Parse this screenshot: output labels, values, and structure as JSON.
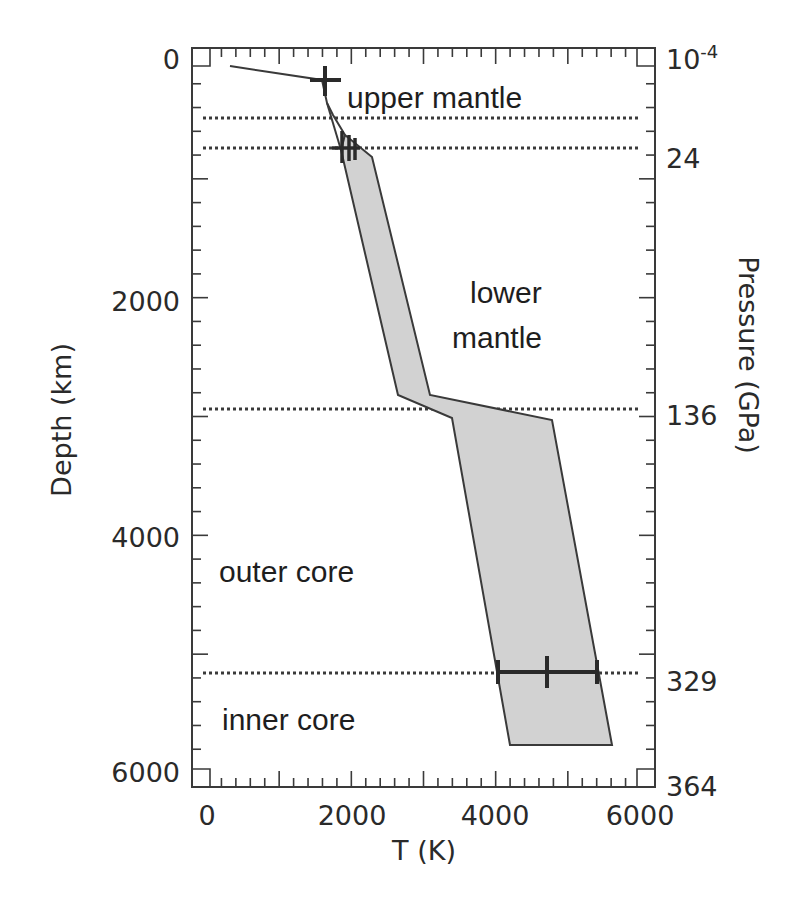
{
  "chart_data": {
    "type": "area",
    "title": "",
    "xlabel": "T (K)",
    "ylabel_left": "Depth (km)",
    "ylabel_right": "Pressure (GPa)",
    "xlim": [
      0,
      6000
    ],
    "ylim": [
      6200,
      0
    ],
    "x_ticks": [
      "0",
      "2000",
      "4000",
      "6000"
    ],
    "y_ticks_left": [
      "0",
      "2000",
      "4000",
      "6000"
    ],
    "y_ticks_right": [
      {
        "label": "10",
        "superscript": "-4",
        "depth": 0
      },
      {
        "label": "24",
        "depth": 660
      },
      {
        "label": "136",
        "depth": 2890
      },
      {
        "label": "329",
        "depth": 5150
      },
      {
        "label": "364",
        "depth": 6200
      }
    ],
    "boundaries_depth_km": [
      410,
      660,
      2890,
      5150
    ],
    "regions": [
      "upper mantle",
      "lower mantle",
      "outer core",
      "inner core"
    ],
    "geotherm_upper_line": [
      {
        "T": 320,
        "depth": 50
      },
      {
        "T": 1600,
        "depth": 170
      },
      {
        "T": 1650,
        "depth": 400
      },
      {
        "T": 1760,
        "depth": 460
      },
      {
        "T": 1925,
        "depth": 630
      }
    ],
    "geotherm_band": {
      "upper_T_edge": [
        {
          "T": 1925,
          "depth": 630
        },
        {
          "T": 2300,
          "depth": 810
        },
        {
          "T": 3100,
          "depth": 2810
        },
        {
          "T": 4810,
          "depth": 3020
        },
        {
          "T": 5650,
          "depth": 5760
        }
      ],
      "lower_T_edge": [
        {
          "T": 1870,
          "depth": 760
        },
        {
          "T": 2660,
          "depth": 2810
        },
        {
          "T": 3420,
          "depth": 3010
        },
        {
          "T": 4230,
          "depth": 5760
        }
      ]
    },
    "error_bars": [
      {
        "T": 1600,
        "depth": 170,
        "T_min": 1400,
        "T_max": 1800
      },
      {
        "T": 1900,
        "depth": 660,
        "T_min": 1750,
        "T_max": 2050
      },
      {
        "T": 4750,
        "depth": 5150,
        "T_min": 4050,
        "T_max": 5450
      }
    ],
    "grid": false,
    "legend": null
  },
  "labels": {
    "x_axis_title": "T (K)",
    "y_left_title": "Depth (km)",
    "y_right_title": "Pressure (GPa)",
    "region_upper_mantle": "upper mantle",
    "region_lower_mantle_1": "lower",
    "region_lower_mantle_2": "mantle",
    "region_outer_core": "outer core",
    "region_inner_core": "inner core",
    "x_tick_0": "0",
    "x_tick_2000": "2000",
    "x_tick_4000": "4000",
    "x_tick_6000": "6000",
    "y_tick_0": "0",
    "y_tick_2000": "2000",
    "y_tick_4000": "4000",
    "y_tick_6000": "6000",
    "p_tick_surface": "10",
    "p_tick_surface_exp": "-4",
    "p_tick_24": "24",
    "p_tick_136": "136",
    "p_tick_329": "329",
    "p_tick_364": "364"
  },
  "colors": {
    "band_fill": "#d2d2d2",
    "line": "#3a3a3a",
    "text": "#2a2a2a",
    "boundary_dots": "#3a3a3a"
  }
}
